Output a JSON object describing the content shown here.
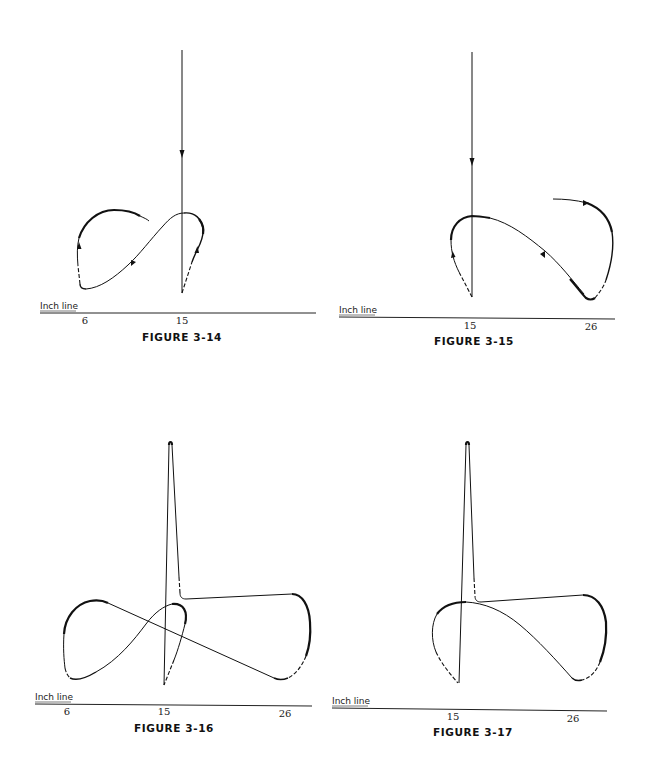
{
  "page": {
    "figures": [
      {
        "id": "fig-3-14",
        "caption": "FIGURE 3-14",
        "axis_label": "Inch line",
        "ticks": [
          {
            "label": "6",
            "x": 85
          },
          {
            "label": "15",
            "x": 182
          }
        ]
      },
      {
        "id": "fig-3-15",
        "caption": "FIGURE 3-15",
        "axis_label": "Inch line",
        "ticks": [
          {
            "label": "15",
            "x": 470
          },
          {
            "label": "26",
            "x": 591
          }
        ]
      },
      {
        "id": "fig-3-16",
        "caption": "FIGURE 3-16",
        "axis_label": "Inch line",
        "ticks": [
          {
            "label": "6",
            "x": 67
          },
          {
            "label": "15",
            "x": 164
          },
          {
            "label": "26",
            "x": 285
          }
        ]
      },
      {
        "id": "fig-3-17",
        "caption": "FIGURE 3-17",
        "axis_label": "Inch line",
        "ticks": [
          {
            "label": "15",
            "x": 453
          },
          {
            "label": "26",
            "x": 573
          }
        ]
      }
    ]
  },
  "colors": {
    "ink": "#111111",
    "background": "#ffffff"
  }
}
